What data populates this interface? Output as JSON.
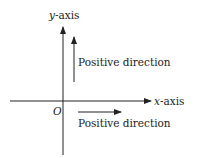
{
  "diagram": {
    "title": "",
    "colors": {
      "stroke": "#222222",
      "text": "#222222",
      "background": "#ffffff"
    },
    "axes": {
      "y_axis": {
        "var": "y",
        "suffix": "-axis"
      },
      "x_axis": {
        "var": "x",
        "suffix": "-axis"
      },
      "origin": "O"
    },
    "arrows": [
      {
        "id": "up",
        "label": "Positive direction",
        "direction": "up"
      },
      {
        "id": "right",
        "label": "Positive direction",
        "direction": "right"
      }
    ]
  }
}
